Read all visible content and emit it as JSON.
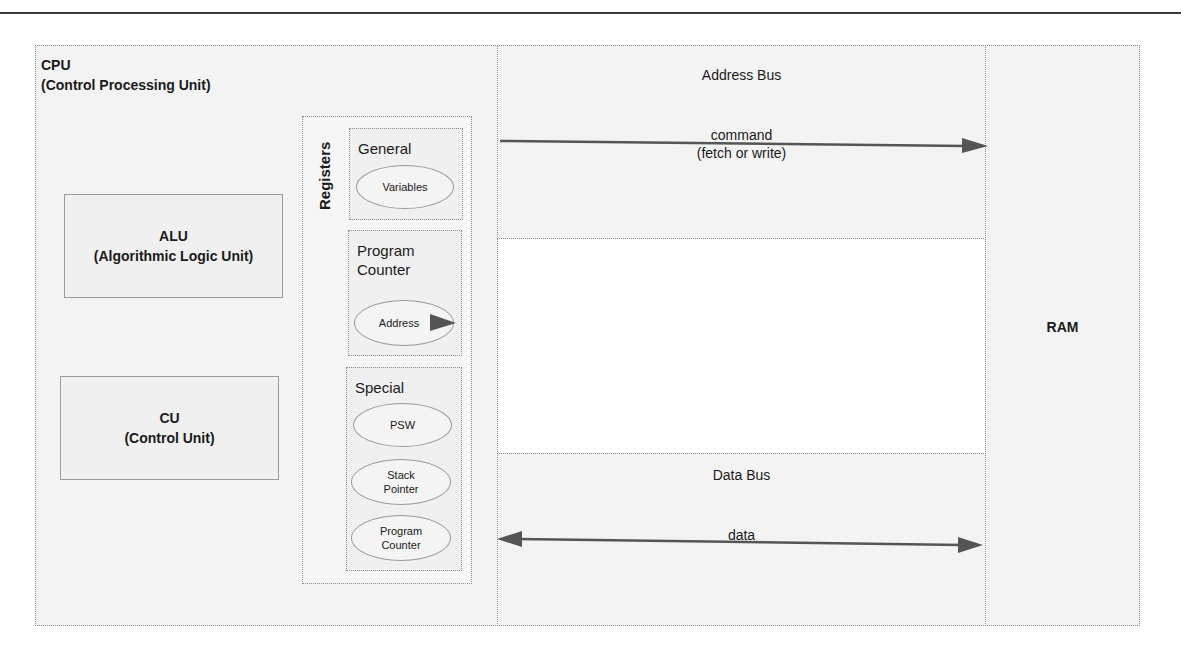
{
  "cpu": {
    "title": "CPU",
    "subtitle": "(Control Processing Unit)",
    "alu": {
      "title": "ALU",
      "subtitle": "(Algorithmic Logic Unit)"
    },
    "cu": {
      "title": "CU",
      "subtitle": "(Control Unit)"
    },
    "registers": {
      "label": "Registers",
      "general": {
        "label": "General",
        "items": [
          "Variables"
        ]
      },
      "program_counter": {
        "label_line1": "Program",
        "label_line2": "Counter",
        "items": [
          "Address"
        ]
      },
      "special": {
        "label": "Special",
        "items": [
          {
            "line1": "PSW",
            "line2": ""
          },
          {
            "line1": "Stack",
            "line2": "Pointer"
          },
          {
            "line1": "Program",
            "line2": "Counter"
          }
        ]
      }
    }
  },
  "address_bus": {
    "title": "Address Bus",
    "arrow_label_line1": "command",
    "arrow_label_line2": "(fetch or write)",
    "direction": "cpu-to-ram"
  },
  "data_bus": {
    "title": "Data Bus",
    "arrow_label": "data",
    "direction": "bidirectional"
  },
  "ram": {
    "title": "RAM"
  },
  "colors": {
    "border": "#8a8a8a",
    "shade": "#f3f3f3",
    "arrow": "#555555"
  }
}
